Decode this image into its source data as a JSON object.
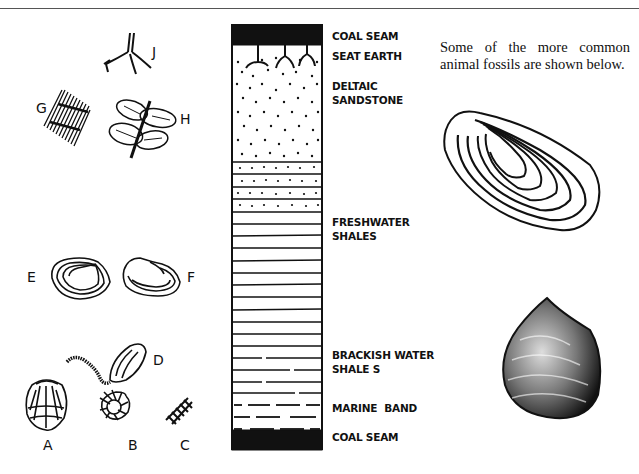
{
  "header": {
    "divider": true
  },
  "column": {
    "title": "Coal measure sequence",
    "layers": [
      {
        "id": "coal-seam-top",
        "label": "COAL SEAM",
        "pattern": "solid-black"
      },
      {
        "id": "seat-earth",
        "label": "SEAT EARTH",
        "pattern": "roots"
      },
      {
        "id": "deltaic-sandstone",
        "label_line1": "DELTAIC",
        "label_line2": "SANDSTONE",
        "pattern": "dots"
      },
      {
        "id": "freshwater-shales",
        "label_line1": "FRESHWATER",
        "label_line2": "SHALES",
        "pattern": "horizontal-lines"
      },
      {
        "id": "brackish-water-shales",
        "label_line1": "BRACKISH WATER",
        "label_line2": "SHALE S",
        "pattern": "broken-lines"
      },
      {
        "id": "marine-band",
        "label": "MARINE  BAND",
        "pattern": "dashed-lines"
      },
      {
        "id": "coal-seam-bottom",
        "label": "COAL SEAM",
        "pattern": "solid-black"
      }
    ]
  },
  "plant_fossils": [
    {
      "letter": "J",
      "name": "root (stigmaria)"
    },
    {
      "letter": "G",
      "name": "stem fragment"
    },
    {
      "letter": "H",
      "name": "fern leaf"
    }
  ],
  "animal_fossils": [
    {
      "letter": "E",
      "name": "freshwater bivalve"
    },
    {
      "letter": "F",
      "name": "freshwater bivalve"
    },
    {
      "letter": "D",
      "name": "worm tube / bivalve"
    },
    {
      "letter": "A",
      "name": "brachiopod"
    },
    {
      "letter": "B",
      "name": "goniatite"
    },
    {
      "letter": "C",
      "name": "crinoid stem"
    }
  ],
  "caption": "Some of the more common animal fossils are shown below.",
  "illustrations": [
    "elongate mussel shell",
    "rounded bivalve shell"
  ]
}
